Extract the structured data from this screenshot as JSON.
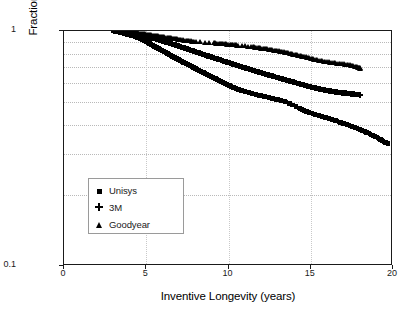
{
  "chart_data": {
    "type": "scatter",
    "title": "",
    "xlabel": "Inventive Longevity (years)",
    "ylabel": "Fraction of Inventors with at Least this Longevity",
    "xlim": [
      0,
      20
    ],
    "ylim": [
      0.1,
      1
    ],
    "yscale": "log",
    "xscale": "linear",
    "grid": true,
    "legend_position": "inside-lower-left",
    "xticks": [
      "0",
      "5",
      "10",
      "15",
      "20"
    ],
    "xtick_values": [
      0,
      5,
      10,
      15,
      20
    ],
    "yticks": [
      "1",
      "0.1"
    ],
    "ytick_values": [
      1,
      0.1
    ],
    "yminor_values": [
      0.9,
      0.8,
      0.7,
      0.6,
      0.5,
      0.4,
      0.3,
      0.2
    ],
    "series": [
      {
        "name": "Unisys",
        "marker": "square",
        "color": "#000000",
        "x": [
          3.0,
          3.15,
          3.3,
          3.45,
          3.6,
          3.75,
          3.9,
          4.05,
          4.2,
          4.35,
          4.5,
          4.65,
          4.8,
          4.95,
          5.1,
          5.25,
          5.4,
          5.55,
          5.7,
          5.85,
          6.0,
          6.15,
          6.3,
          6.45,
          6.6,
          6.75,
          6.9,
          7.05,
          7.2,
          7.35,
          7.5,
          7.65,
          7.8,
          7.95,
          8.1,
          8.25,
          8.4,
          8.55,
          8.7,
          8.85,
          9.0,
          9.2,
          9.4,
          9.6,
          9.8,
          10.0,
          10.2,
          10.4,
          10.6,
          10.8,
          11.0,
          11.25,
          11.5,
          11.75,
          12.0,
          12.3,
          12.6,
          12.9,
          13.2,
          13.5,
          14.3,
          14.5,
          14.7,
          14.9,
          15.2,
          15.5,
          15.9,
          16.3,
          16.7,
          17.1,
          17.5,
          17.9,
          18.3,
          18.7,
          19.1,
          19.4,
          19.7
        ],
        "y": [
          1.0,
          0.995,
          0.99,
          0.985,
          0.978,
          0.972,
          0.966,
          0.96,
          0.953,
          0.946,
          0.938,
          0.928,
          0.918,
          0.906,
          0.893,
          0.88,
          0.868,
          0.856,
          0.845,
          0.834,
          0.823,
          0.812,
          0.801,
          0.79,
          0.78,
          0.77,
          0.76,
          0.75,
          0.74,
          0.731,
          0.722,
          0.713,
          0.704,
          0.695,
          0.686,
          0.677,
          0.669,
          0.661,
          0.653,
          0.645,
          0.637,
          0.627,
          0.617,
          0.607,
          0.597,
          0.588,
          0.579,
          0.571,
          0.564,
          0.558,
          0.553,
          0.547,
          0.541,
          0.535,
          0.53,
          0.524,
          0.518,
          0.512,
          0.506,
          0.5,
          0.47,
          0.462,
          0.455,
          0.45,
          0.443,
          0.437,
          0.428,
          0.42,
          0.411,
          0.402,
          0.393,
          0.383,
          0.373,
          0.362,
          0.35,
          0.34,
          0.332
        ]
      },
      {
        "name": "3M",
        "marker": "plus",
        "color": "#000000",
        "x": [
          3.0,
          3.2,
          3.4,
          3.6,
          3.8,
          4.0,
          4.2,
          4.4,
          4.6,
          4.8,
          5.0,
          5.2,
          5.4,
          5.6,
          5.8,
          6.0,
          6.2,
          6.4,
          6.6,
          6.8,
          7.0,
          7.2,
          7.4,
          7.6,
          7.8,
          8.0,
          8.2,
          8.4,
          8.6,
          8.8,
          9.0,
          9.2,
          9.4,
          9.6,
          9.8,
          10.0,
          10.3,
          10.6,
          10.9,
          11.2,
          11.5,
          11.8,
          12.1,
          12.4,
          12.7,
          13.0,
          13.3,
          13.6,
          13.9,
          14.2,
          14.5,
          14.8,
          15.1,
          15.4,
          15.7,
          16.0,
          16.3,
          16.6,
          16.9,
          17.2,
          17.5,
          17.8,
          18.0
        ],
        "y": [
          1.0,
          0.996,
          0.992,
          0.988,
          0.983,
          0.978,
          0.973,
          0.967,
          0.961,
          0.955,
          0.948,
          0.94,
          0.932,
          0.924,
          0.915,
          0.906,
          0.897,
          0.888,
          0.879,
          0.87,
          0.861,
          0.852,
          0.843,
          0.834,
          0.825,
          0.816,
          0.807,
          0.798,
          0.789,
          0.781,
          0.773,
          0.765,
          0.757,
          0.749,
          0.741,
          0.733,
          0.722,
          0.711,
          0.7,
          0.69,
          0.68,
          0.67,
          0.66,
          0.651,
          0.642,
          0.633,
          0.624,
          0.615,
          0.607,
          0.599,
          0.591,
          0.583,
          0.576,
          0.569,
          0.563,
          0.558,
          0.553,
          0.549,
          0.546,
          0.543,
          0.54,
          0.537,
          0.535
        ]
      },
      {
        "name": "Goodyear",
        "marker": "triangle",
        "color": "#000000",
        "x": [
          3.05,
          3.3,
          3.55,
          3.8,
          4.05,
          4.3,
          4.55,
          4.8,
          5.05,
          5.3,
          5.55,
          5.8,
          6.05,
          6.3,
          6.55,
          6.8,
          7.05,
          7.4,
          7.7,
          8.0,
          9.1,
          9.4,
          9.7,
          10.0,
          10.3,
          10.6,
          11.4,
          11.7,
          12.0,
          12.3,
          12.6,
          12.9,
          13.2,
          13.5,
          13.8,
          14.1,
          14.4,
          14.7,
          15.0,
          15.3,
          15.7,
          16.1,
          16.5,
          16.9,
          17.3,
          17.6,
          17.9,
          18.0
        ],
        "y": [
          1.0,
          0.997,
          0.994,
          0.99,
          0.986,
          0.982,
          0.977,
          0.972,
          0.966,
          0.96,
          0.954,
          0.948,
          0.942,
          0.936,
          0.93,
          0.924,
          0.918,
          0.911,
          0.905,
          0.9,
          0.888,
          0.884,
          0.88,
          0.876,
          0.872,
          0.868,
          0.855,
          0.85,
          0.844,
          0.838,
          0.831,
          0.824,
          0.816,
          0.808,
          0.8,
          0.791,
          0.782,
          0.773,
          0.764,
          0.755,
          0.745,
          0.737,
          0.73,
          0.724,
          0.718,
          0.71,
          0.7,
          0.693
        ]
      }
    ]
  },
  "legend": {
    "items": [
      {
        "label": "Unisys",
        "marker": "square"
      },
      {
        "label": "3M",
        "marker": "plus"
      },
      {
        "label": "Goodyear",
        "marker": "triangle"
      }
    ]
  }
}
